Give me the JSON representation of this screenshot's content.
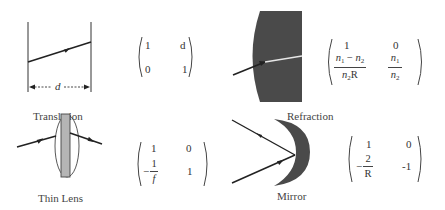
{
  "panels": {
    "translation": {
      "label": "Translation",
      "distance_symbol": "d",
      "matrix": {
        "a": "1",
        "b": "d",
        "c": "0",
        "d": "1"
      }
    },
    "refraction": {
      "label": "Refraction",
      "matrix": {
        "a": "1",
        "b": "0",
        "c_num_n1": "n",
        "c_num_sub1": "1",
        "c_num_minus": " − ",
        "c_num_n2": "n",
        "c_num_sub2": "2",
        "c_den_n": "n",
        "c_den_sub": "2",
        "c_den_R": "R",
        "d_num": "n",
        "d_num_sub": "1",
        "d_den": "n",
        "d_den_sub": "2"
      }
    },
    "thin_lens": {
      "label": "Thin Lens",
      "matrix": {
        "a": "1",
        "b": "0",
        "c_sign": "−",
        "c_num": "1",
        "c_den": "f",
        "d": "1"
      }
    },
    "mirror": {
      "label": "Mirror",
      "matrix": {
        "a": "1",
        "b": "0",
        "c_sign": "−",
        "c_num": "2",
        "c_den": "R",
        "d": "-1"
      }
    }
  },
  "colors": {
    "ink": "#222222",
    "medium": "#4a4a4a",
    "lens_fill": "#b5b5b5",
    "background": "#ffffff"
  }
}
